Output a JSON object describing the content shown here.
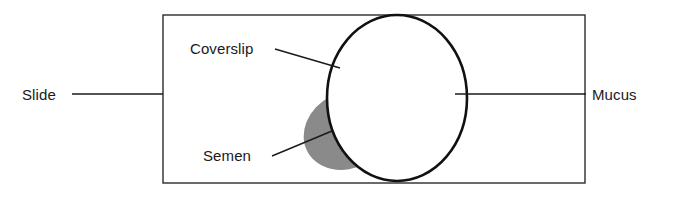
{
  "figure": {
    "background_color": "#ffffff",
    "line_color": "#1a1a1a"
  },
  "shapes": {
    "slide": {
      "name": "slide-rectangle",
      "x": 163,
      "y": 15,
      "width": 422,
      "height": 168,
      "fill": "#ffffff",
      "stroke": "#2b2b2b"
    },
    "coverslip": {
      "name": "coverslip-circle",
      "cx": 397,
      "cy": 98,
      "rx": 70,
      "ry": 83,
      "fill": "#ffffff",
      "stroke": "#111111"
    },
    "semen": {
      "name": "semen-blob",
      "cx": 348,
      "cy": 130,
      "rx": 46,
      "ry": 38,
      "rotation": -28,
      "fill": "#8a8a8a"
    },
    "mucus": {
      "name": "mucus-blob",
      "fill": "#c6c6c6"
    }
  },
  "labels": {
    "slide": {
      "text": "Slide",
      "x": 22,
      "y": 100,
      "leader": {
        "x1": 72,
        "y1": 94,
        "x2": 163,
        "y2": 94
      }
    },
    "coverslip": {
      "text": "Coverslip",
      "x": 190,
      "y": 54,
      "leader": {
        "x1": 275,
        "y1": 49,
        "x2": 340,
        "y2": 68
      }
    },
    "semen": {
      "text": "Semen",
      "x": 203,
      "y": 161,
      "leader": {
        "x1": 272,
        "y1": 156,
        "x2": 332,
        "y2": 131
      }
    },
    "mucus": {
      "text": "Mucus",
      "x": 592,
      "y": 100,
      "leader": {
        "x1": 455,
        "y1": 94,
        "x2": 586,
        "y2": 94
      }
    }
  }
}
